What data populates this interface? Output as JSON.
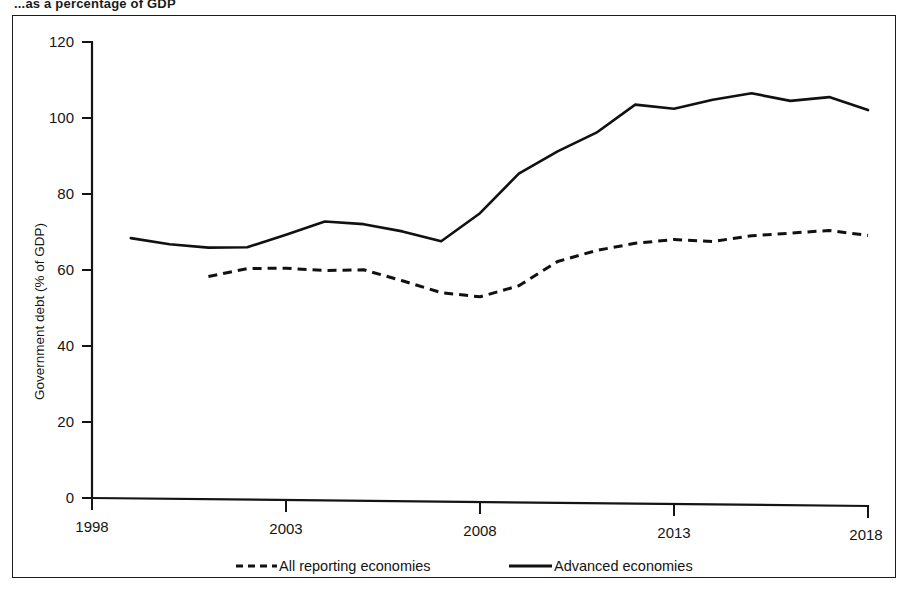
{
  "figure": {
    "caption_partial": "...as a percentage of GDP",
    "frame_border_color": "#1b1b1b",
    "background_color": "#ffffff"
  },
  "chart_data": {
    "type": "line",
    "title": "",
    "xlabel": "",
    "ylabel": "Government debt (% of GDP)",
    "xlim": [
      1998,
      2018
    ],
    "ylim": [
      0,
      120
    ],
    "xticks": [
      1998,
      2003,
      2008,
      2013,
      2018
    ],
    "yticks": [
      0,
      20,
      40,
      60,
      80,
      100,
      120
    ],
    "xtick_labels": [
      "1998",
      "2003",
      "2008",
      "2013",
      "2018"
    ],
    "ytick_labels": [
      "0",
      "20",
      "40",
      "60",
      "80",
      "100",
      "120"
    ],
    "grid": false,
    "legend_position": "bottom",
    "line_color": "#111111",
    "series": [
      {
        "name": "All reporting economies",
        "style": "dashed",
        "x": [
          2001,
          2002,
          2003,
          2004,
          2005,
          2006,
          2007,
          2008,
          2009,
          2010,
          2011,
          2012,
          2013,
          2014,
          2015,
          2016,
          2017,
          2018
        ],
        "values": [
          58.6,
          60.8,
          61.0,
          60.5,
          60.8,
          58.0,
          55.0,
          54.0,
          57.0,
          63.5,
          66.5,
          68.5,
          69.6,
          69.2,
          70.8,
          71.6,
          72.4,
          71.2
        ]
      },
      {
        "name": "Advanced economies",
        "style": "solid",
        "x": [
          1999,
          2000,
          2001,
          2002,
          2003,
          2004,
          2005,
          2006,
          2007,
          2008,
          2009,
          2010,
          2011,
          2012,
          2013,
          2014,
          2015,
          2016,
          2017,
          2018
        ],
        "values": [
          68.5,
          67.0,
          66.2,
          66.4,
          69.8,
          73.4,
          72.8,
          71.0,
          68.5,
          76.0,
          86.5,
          92.5,
          97.5,
          105.0,
          104.0,
          106.5,
          108.3,
          106.4,
          107.5,
          104.2
        ]
      }
    ]
  },
  "legend": {
    "entries": [
      {
        "label": "All reporting economies",
        "style": "dashed"
      },
      {
        "label": "Advanced economies",
        "style": "solid"
      }
    ]
  }
}
